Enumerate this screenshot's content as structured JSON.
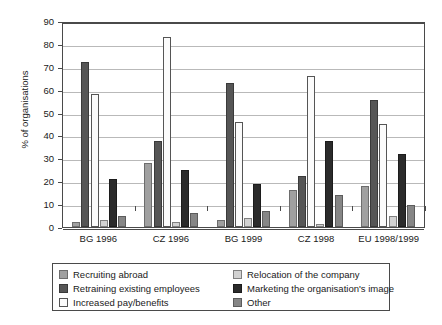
{
  "chart_data": {
    "type": "bar",
    "title": "",
    "xlabel": "",
    "ylabel": "% of organisations",
    "ylim": [
      0,
      90
    ],
    "ytick_step": 10,
    "yticks": [
      90,
      80,
      70,
      60,
      50,
      40,
      30,
      20,
      10,
      0
    ],
    "grid": true,
    "legend_position": "bottom",
    "categories": [
      "BG 1996",
      "CZ 1996",
      "BG 1999",
      "CZ 1998",
      "EU 1998/1999"
    ],
    "series": [
      {
        "name": "Recruiting abroad",
        "color": "#a0a0a0",
        "values": [
          2,
          28,
          3,
          16,
          18
        ]
      },
      {
        "name": "Retraining existing employees",
        "color": "#565656",
        "values": [
          72,
          37.5,
          63,
          22.5,
          55.5
        ]
      },
      {
        "name": "Increased pay/benefits",
        "color": "#fbfbfb",
        "values": [
          58,
          83,
          46,
          66,
          45
        ]
      },
      {
        "name": "Relocation of the company",
        "color": "#d2d2d2",
        "values": [
          3,
          2,
          4,
          1.5,
          5
        ]
      },
      {
        "name": "Marketing the organisation's image",
        "color": "#2b2b2b",
        "values": [
          21,
          25,
          19,
          37.5,
          32
        ]
      },
      {
        "name": "Other",
        "color": "#868686",
        "values": [
          5,
          6,
          7,
          14,
          9.5
        ]
      }
    ]
  }
}
